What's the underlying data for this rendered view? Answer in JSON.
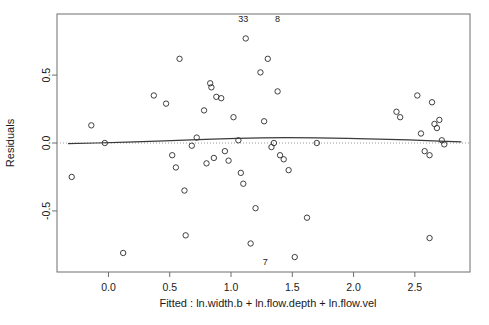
{
  "chart_data": {
    "type": "scatter",
    "title": "",
    "xlabel": "Fitted : ln.width.b + ln.flow.depth + ln.flow.vel",
    "ylabel": "Residuals",
    "xlim": [
      -0.42,
      2.95
    ],
    "ylim": [
      -0.95,
      0.95
    ],
    "xticks": [
      0.0,
      0.5,
      1.0,
      1.5,
      2.0,
      2.5
    ],
    "xtick_labels": [
      "0.0",
      "0.5",
      "1.0",
      "1.5",
      "2.0",
      "2.5"
    ],
    "yticks": [
      -0.5,
      0.0,
      0.5
    ],
    "ytick_labels": [
      "-0.5",
      "0.0",
      "0.5"
    ],
    "grid": false,
    "legend": "none",
    "zero_reference_line": 0.0,
    "point_marker": "open-circle",
    "x": [
      -0.3,
      -0.14,
      -0.03,
      0.12,
      0.37,
      0.47,
      0.52,
      0.55,
      0.58,
      0.62,
      0.63,
      0.68,
      0.72,
      0.78,
      0.8,
      0.83,
      0.84,
      0.86,
      0.88,
      0.92,
      0.95,
      0.98,
      1.02,
      1.06,
      1.08,
      1.1,
      1.12,
      1.16,
      1.2,
      1.24,
      1.27,
      1.3,
      1.33,
      1.35,
      1.38,
      1.4,
      1.43,
      1.47,
      1.52,
      1.62,
      1.7,
      2.35,
      2.38,
      2.52,
      2.55,
      2.58,
      2.62,
      2.64,
      2.66,
      2.68,
      2.7,
      2.72,
      2.74,
      2.62
    ],
    "y": [
      -0.25,
      0.13,
      0.0,
      -0.81,
      0.35,
      0.29,
      -0.09,
      -0.18,
      0.62,
      -0.35,
      -0.68,
      -0.02,
      0.04,
      0.24,
      -0.15,
      0.44,
      0.41,
      -0.11,
      0.34,
      0.33,
      -0.06,
      -0.13,
      0.19,
      0.02,
      -0.22,
      -0.3,
      0.77,
      -0.74,
      -0.48,
      0.52,
      0.16,
      0.62,
      -0.03,
      0.0,
      0.38,
      -0.09,
      -0.12,
      -0.2,
      -0.84,
      -0.55,
      0.0,
      0.23,
      0.19,
      0.35,
      0.07,
      -0.06,
      -0.09,
      0.3,
      0.14,
      0.11,
      0.17,
      0.02,
      -0.01,
      -0.7
    ],
    "smoother_x": [
      -0.33,
      -0.1,
      0.15,
      0.4,
      0.62,
      0.85,
      1.05,
      1.25,
      1.45,
      1.7,
      1.95,
      2.2,
      2.45,
      2.7,
      2.88
    ],
    "smoother_y": [
      -0.005,
      0.0,
      0.007,
      0.014,
      0.021,
      0.028,
      0.034,
      0.038,
      0.04,
      0.038,
      0.034,
      0.029,
      0.023,
      0.014,
      0.008
    ],
    "point_labels": [
      {
        "text": "33",
        "x": 1.1,
        "y": 0.89
      },
      {
        "text": "8",
        "x": 1.38,
        "y": 0.89
      },
      {
        "text": "7",
        "x": 1.28,
        "y": -0.9
      }
    ],
    "colors": {
      "point": "#2b2b2b",
      "smoother": "#3a3a3a",
      "zero_line": "#9a9a9a",
      "frame": "#6e6e6e",
      "background": "#ffffff"
    }
  }
}
